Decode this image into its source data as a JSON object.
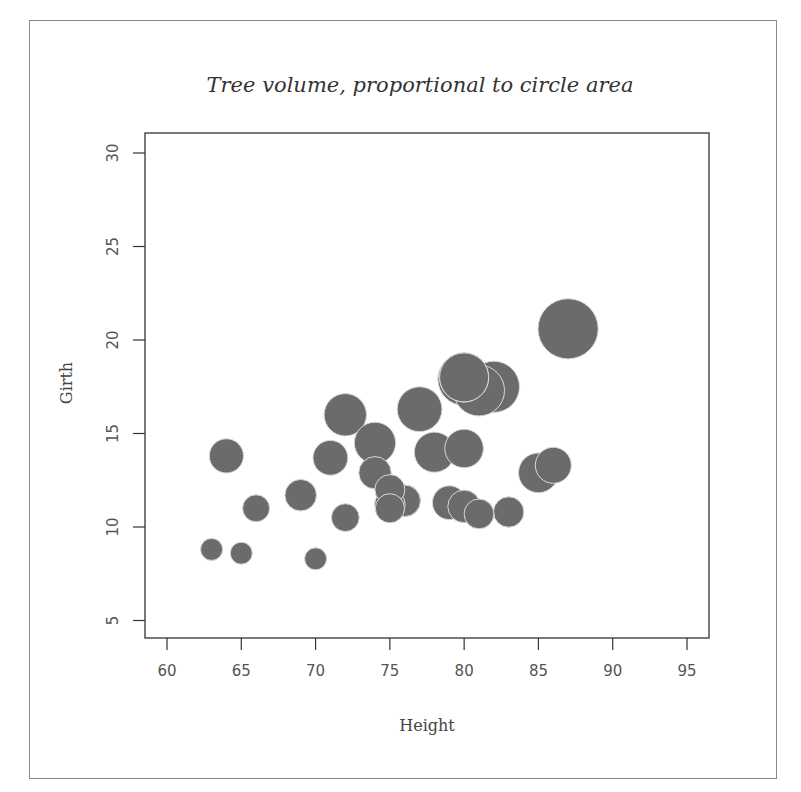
{
  "chart_data": {
    "type": "scatter",
    "subtype": "bubble",
    "title": "Tree volume, proportional to circle area",
    "xlabel": "Height",
    "ylabel": "Girth",
    "xlim": [
      58.5,
      96.4
    ],
    "ylim": [
      4,
      31
    ],
    "x_ticks": [
      60,
      65,
      70,
      75,
      80,
      85,
      90,
      95
    ],
    "y_ticks": [
      5,
      10,
      15,
      20,
      25,
      30
    ],
    "grid": false,
    "legend": null,
    "bubble_color": "#6b6b6b",
    "bubble_edge": "#d9d9d9",
    "size_variable": "Volume",
    "points": [
      {
        "height": 70,
        "girth": 8.3,
        "volume": 10.3
      },
      {
        "height": 65,
        "girth": 8.6,
        "volume": 10.3
      },
      {
        "height": 63,
        "girth": 8.8,
        "volume": 10.2
      },
      {
        "height": 72,
        "girth": 10.5,
        "volume": 16.4
      },
      {
        "height": 81,
        "girth": 10.7,
        "volume": 18.8
      },
      {
        "height": 83,
        "girth": 10.8,
        "volume": 19.7
      },
      {
        "height": 66,
        "girth": 11.0,
        "volume": 15.6
      },
      {
        "height": 75,
        "girth": 11.0,
        "volume": 18.2
      },
      {
        "height": 80,
        "girth": 11.1,
        "volume": 22.6
      },
      {
        "height": 75,
        "girth": 11.2,
        "volume": 19.9
      },
      {
        "height": 79,
        "girth": 11.3,
        "volume": 24.2
      },
      {
        "height": 76,
        "girth": 11.4,
        "volume": 21.0
      },
      {
        "height": 76,
        "girth": 11.4,
        "volume": 21.4
      },
      {
        "height": 69,
        "girth": 11.7,
        "volume": 21.3
      },
      {
        "height": 75,
        "girth": 12.0,
        "volume": 19.1
      },
      {
        "height": 74,
        "girth": 12.9,
        "volume": 22.2
      },
      {
        "height": 85,
        "girth": 12.9,
        "volume": 33.8
      },
      {
        "height": 86,
        "girth": 13.3,
        "volume": 27.4
      },
      {
        "height": 71,
        "girth": 13.7,
        "volume": 25.7
      },
      {
        "height": 64,
        "girth": 13.8,
        "volume": 24.9
      },
      {
        "height": 78,
        "girth": 14.0,
        "volume": 34.5
      },
      {
        "height": 80,
        "girth": 14.2,
        "volume": 31.7
      },
      {
        "height": 74,
        "girth": 14.5,
        "volume": 36.3
      },
      {
        "height": 72,
        "girth": 16.0,
        "volume": 38.3
      },
      {
        "height": 77,
        "girth": 16.3,
        "volume": 42.6
      },
      {
        "height": 81,
        "girth": 17.3,
        "volume": 55.4
      },
      {
        "height": 82,
        "girth": 17.5,
        "volume": 55.7
      },
      {
        "height": 80,
        "girth": 17.9,
        "volume": 58.3
      },
      {
        "height": 80,
        "girth": 18.0,
        "volume": 51.5
      },
      {
        "height": 80,
        "girth": 18.0,
        "volume": 51.0
      },
      {
        "height": 87,
        "girth": 20.6,
        "volume": 77.0
      }
    ]
  }
}
